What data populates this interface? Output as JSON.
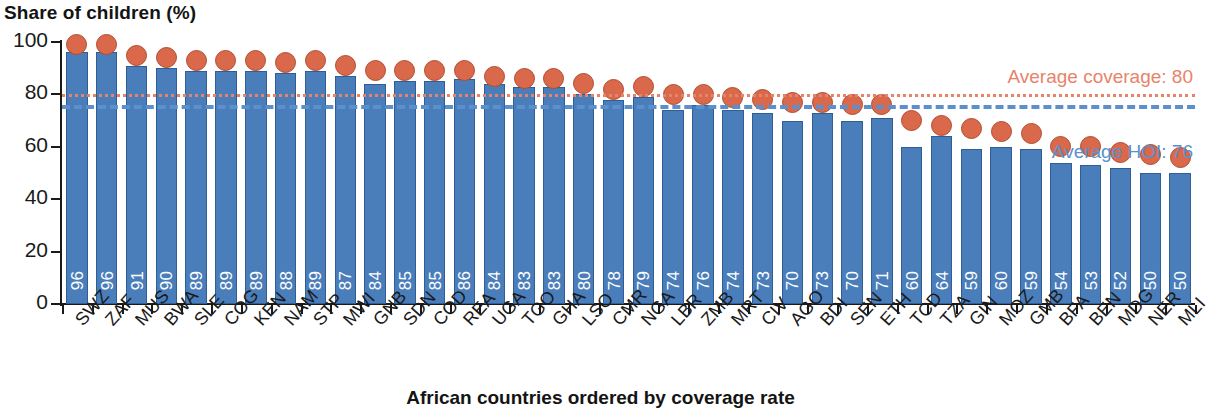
{
  "chart_data": {
    "type": "bar",
    "title": "Share of children (%)",
    "ylabel": "Share of children (%)",
    "xlabel": "African countries ordered by coverage rate",
    "ylim": [
      0,
      100
    ],
    "yticks": [
      0,
      20,
      40,
      60,
      80,
      100
    ],
    "grid": false,
    "legend_position": "none",
    "categories": [
      "SWZ",
      "ZAF",
      "MUS",
      "BWA",
      "SLE",
      "COG",
      "KEN",
      "NAM",
      "STP",
      "MWI",
      "GNB",
      "SDN",
      "COD",
      "REA",
      "UGA",
      "TGO",
      "GHA",
      "LSO",
      "CMR",
      "NGA",
      "LBR",
      "ZMB",
      "MRT",
      "CIV",
      "AGO",
      "BDI",
      "SEN",
      "ETH",
      "TCD",
      "TZA",
      "GIN",
      "MOZ",
      "GMB",
      "BFA",
      "BEN",
      "MDG",
      "NER",
      "MLI"
    ],
    "series": [
      {
        "name": "HOI",
        "type": "bar",
        "color": "#4a7ebb",
        "values": [
          96,
          96,
          91,
          90,
          89,
          89,
          89,
          88,
          89,
          87,
          84,
          85,
          85,
          86,
          84,
          83,
          83,
          80,
          78,
          79,
          74,
          76,
          74,
          73,
          70,
          73,
          70,
          71,
          60,
          64,
          59,
          60,
          59,
          54,
          53,
          52,
          50,
          50
        ]
      },
      {
        "name": "Coverage rate",
        "type": "scatter",
        "color": "#d9694a",
        "values": [
          99,
          99,
          95,
          94,
          93,
          93,
          93,
          92,
          93,
          91,
          89,
          89,
          89,
          89,
          87,
          86,
          86,
          84,
          82,
          83,
          80,
          80,
          79,
          78,
          77,
          77,
          76,
          76,
          70,
          68,
          67,
          66,
          65,
          60,
          60,
          58,
          57,
          56
        ]
      }
    ],
    "reference_lines": [
      {
        "name": "Average coverage",
        "value": 80,
        "label": "Average coverage: 80",
        "color": "#e8836a",
        "style": "dotted"
      },
      {
        "name": "Average HOI",
        "value": 76,
        "label": "Average HOI: 76",
        "color": "#5b90cd",
        "style": "dashed"
      }
    ]
  }
}
